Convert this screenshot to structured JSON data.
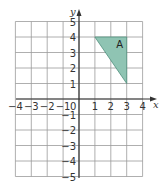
{
  "diagram": {
    "type": "coordinate-grid",
    "x_axis": {
      "label": "x",
      "min": -4,
      "max": 4,
      "ticks": [
        "−4",
        "−3",
        "−2",
        "−1",
        "1",
        "2",
        "3",
        "4"
      ]
    },
    "y_axis": {
      "label": "y",
      "min": -5,
      "max": 5,
      "ticks": [
        "5",
        "4",
        "3",
        "2",
        "1",
        "−1",
        "−2",
        "−3",
        "−4",
        "−5"
      ]
    },
    "origin_label": "0",
    "shapes": [
      {
        "name": "A",
        "label": "A",
        "vertices": [
          [
            1,
            4
          ],
          [
            3,
            4
          ],
          [
            3,
            1
          ]
        ],
        "fill": "#8fc4b3",
        "stroke": "#4f8f7c"
      }
    ],
    "colors": {
      "grid": "#9a9a9a",
      "axis": "#333333"
    }
  }
}
